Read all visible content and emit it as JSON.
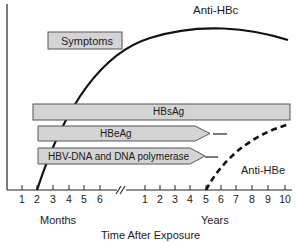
{
  "diagram": {
    "curves": {
      "anti_hbc": "Anti-HBc",
      "anti_hbe": "Anti-HBe"
    },
    "bars": {
      "symptoms": "Symptoms",
      "hbsag": "HBsAg",
      "hbeag": "HBeAg",
      "hbv_dna": "HBV-DNA and DNA polymerase"
    },
    "x_axis": {
      "label": "Time After Exposure",
      "months_label": "Months",
      "years_label": "Years",
      "month_ticks": [
        "1",
        "2",
        "3",
        "4",
        "5",
        "6"
      ],
      "year_ticks": [
        "1",
        "2",
        "3",
        "4",
        "5",
        "6",
        "7",
        "8",
        "9",
        "10"
      ]
    },
    "colors": {
      "bar_fill": "#d4d4d4",
      "bar_stroke": "#555555",
      "line": "#111111"
    }
  }
}
